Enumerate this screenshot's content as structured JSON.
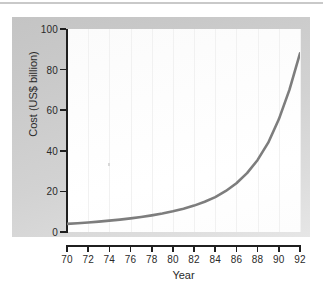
{
  "figure": {
    "background_color": "#ffffff",
    "panel_color": "#cfcfcf",
    "canvas_color": "#fdfdfd"
  },
  "chart_data": {
    "type": "line",
    "title": "",
    "xlabel": "Year",
    "ylabel": "Cost (US$ billion)",
    "xlim": [
      70,
      92
    ],
    "ylim": [
      0,
      100
    ],
    "xticks": [
      "70",
      "72",
      "74",
      "76",
      "78",
      "80",
      "82",
      "84",
      "86",
      "88",
      "90",
      "92"
    ],
    "yticks": [
      "0",
      "20",
      "40",
      "60",
      "80",
      "100"
    ],
    "grid": "vertical-faint",
    "legend": "none",
    "line_color": "#7d7d7d",
    "line_width": 2.6,
    "x": [
      70,
      71,
      72,
      73,
      74,
      75,
      76,
      77,
      78,
      79,
      80,
      81,
      82,
      83,
      84,
      85,
      86,
      87,
      88,
      89,
      90,
      91,
      92
    ],
    "values": [
      4,
      4.3,
      4.7,
      5.1,
      5.6,
      6.1,
      6.7,
      7.4,
      8.2,
      9.1,
      10.2,
      11.5,
      13.0,
      14.9,
      17.2,
      20.2,
      24.0,
      29.0,
      35.5,
      44.0,
      55.5,
      70.0,
      88.0
    ],
    "series": [
      {
        "name": "Cost",
        "values": [
          4,
          4.3,
          4.7,
          5.1,
          5.6,
          6.1,
          6.7,
          7.4,
          8.2,
          9.1,
          10.2,
          11.5,
          13.0,
          14.9,
          17.2,
          20.2,
          24.0,
          29.0,
          35.5,
          44.0,
          55.5,
          70.0,
          88.0
        ]
      }
    ]
  }
}
